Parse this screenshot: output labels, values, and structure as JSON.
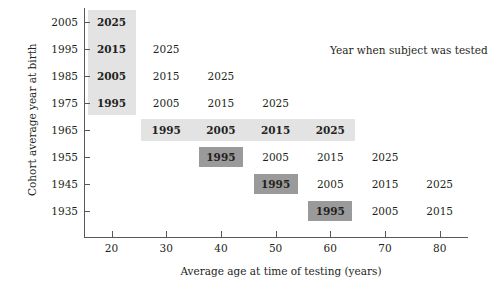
{
  "chart_data": {
    "type": "table",
    "title": "",
    "xlabel": "Average age at time of testing (years)",
    "ylabel": "Cohort average year at birth",
    "annotation": "Year when subject was tested",
    "xlim": [
      15,
      85
    ],
    "ylim": [
      1930,
      2010
    ],
    "xticks": [
      20,
      30,
      40,
      50,
      60,
      70,
      80
    ],
    "xtick_labels": [
      "20",
      "30",
      "40",
      "50",
      "60",
      "70",
      "80"
    ],
    "yticks": [
      2005,
      1995,
      1985,
      1975,
      1965,
      1955,
      1945,
      1935
    ],
    "ytick_labels": [
      "2005",
      "1995",
      "1985",
      "1975",
      "1965",
      "1955",
      "1945",
      "1935"
    ],
    "grid": false,
    "legend_position": "none",
    "cell_value_label": "Year when subject was tested",
    "colors": {
      "highlight_light": "#e3e3e3",
      "highlight_dark": "#9a9a9a",
      "text": "#231f20",
      "axis": "#58595b",
      "background": "#ffffff"
    },
    "rows": [
      {
        "birth_year": 2005,
        "cells": [
          {
            "age": 20,
            "test_year": "2025",
            "shade": "light"
          }
        ]
      },
      {
        "birth_year": 1995,
        "cells": [
          {
            "age": 20,
            "test_year": "2015",
            "shade": "light"
          },
          {
            "age": 30,
            "test_year": "2025",
            "shade": "none"
          }
        ]
      },
      {
        "birth_year": 1985,
        "cells": [
          {
            "age": 20,
            "test_year": "2005",
            "shade": "light"
          },
          {
            "age": 30,
            "test_year": "2015",
            "shade": "none"
          },
          {
            "age": 40,
            "test_year": "2025",
            "shade": "none"
          }
        ]
      },
      {
        "birth_year": 1975,
        "cells": [
          {
            "age": 20,
            "test_year": "1995",
            "shade": "light"
          },
          {
            "age": 30,
            "test_year": "2005",
            "shade": "none"
          },
          {
            "age": 40,
            "test_year": "2015",
            "shade": "none"
          },
          {
            "age": 50,
            "test_year": "2025",
            "shade": "none"
          }
        ]
      },
      {
        "birth_year": 1965,
        "cells": [
          {
            "age": 30,
            "test_year": "1995",
            "shade": "light"
          },
          {
            "age": 40,
            "test_year": "2005",
            "shade": "light"
          },
          {
            "age": 50,
            "test_year": "2015",
            "shade": "light"
          },
          {
            "age": 60,
            "test_year": "2025",
            "shade": "light"
          }
        ]
      },
      {
        "birth_year": 1955,
        "cells": [
          {
            "age": 40,
            "test_year": "1995",
            "shade": "dark"
          },
          {
            "age": 50,
            "test_year": "2005",
            "shade": "none"
          },
          {
            "age": 60,
            "test_year": "2015",
            "shade": "none"
          },
          {
            "age": 70,
            "test_year": "2025",
            "shade": "none"
          }
        ]
      },
      {
        "birth_year": 1945,
        "cells": [
          {
            "age": 50,
            "test_year": "1995",
            "shade": "dark"
          },
          {
            "age": 60,
            "test_year": "2005",
            "shade": "none"
          },
          {
            "age": 70,
            "test_year": "2015",
            "shade": "none"
          },
          {
            "age": 80,
            "test_year": "2025",
            "shade": "none"
          }
        ]
      },
      {
        "birth_year": 1935,
        "cells": [
          {
            "age": 60,
            "test_year": "1995",
            "shade": "dark"
          },
          {
            "age": 70,
            "test_year": "2005",
            "shade": "none"
          },
          {
            "age": 80,
            "test_year": "2015",
            "shade": "none"
          }
        ]
      }
    ],
    "highlight_regions": [
      {
        "kind": "column",
        "description": "cross-sectional slice at age 20",
        "age": 20,
        "birth_years": [
          2005,
          1995,
          1985,
          1975
        ],
        "shade": "light"
      },
      {
        "kind": "row",
        "description": "longitudinal slice for 1965 cohort",
        "birth_year": 1965,
        "ages": [
          30,
          40,
          50,
          60
        ],
        "shade": "light"
      },
      {
        "kind": "cells",
        "description": "time-lag slice tested in 1995",
        "test_year": "1995",
        "shade": "dark",
        "points": [
          {
            "age": 40,
            "birth_year": 1955
          },
          {
            "age": 50,
            "birth_year": 1945
          },
          {
            "age": 60,
            "birth_year": 1935
          }
        ]
      }
    ]
  }
}
